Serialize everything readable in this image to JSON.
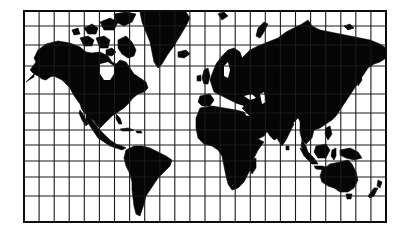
{
  "map": {
    "title": "World map",
    "projection": "Mercator-style rectangular grid",
    "style": "black land silhouettes on white with graticule",
    "colors": {
      "land": "#050505",
      "water": "#ffffff",
      "grid": "#1a1a1a",
      "frame": "#0d0d0d"
    },
    "frame": {
      "x": 24,
      "y": 11,
      "width": 362,
      "height": 211
    },
    "graticule": {
      "columns": 24,
      "vertical_line_spacing_px": 15.08,
      "horizontal_lines_y": [
        26,
        45,
        66,
        94,
        113,
        130,
        145,
        161,
        177,
        196
      ]
    },
    "landmasses": [
      "North America",
      "Greenland",
      "Canadian Arctic Archipelago",
      "South America",
      "Europe",
      "Africa",
      "Madagascar",
      "Asia",
      "Arabian Peninsula",
      "Indian Subcontinent",
      "Japan",
      "Southeast Asia",
      "Indonesia",
      "New Guinea",
      "Australia",
      "Tasmania",
      "New Zealand",
      "Iceland",
      "British Isles",
      "Novaya Zemlya",
      "Svalbard",
      "New Siberian Islands",
      "Caribbean islands"
    ]
  }
}
